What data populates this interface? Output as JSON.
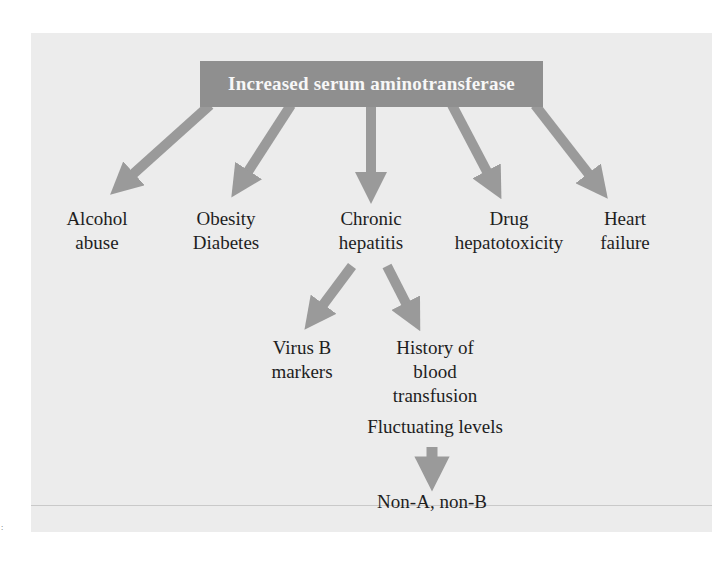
{
  "diagram": {
    "root": {
      "label": "Increased serum aminotransferase"
    },
    "causes": [
      {
        "id": "alcohol",
        "lines": [
          "Alcohol",
          "abuse"
        ]
      },
      {
        "id": "obesity",
        "lines": [
          "Obesity",
          "Diabetes"
        ]
      },
      {
        "id": "chronic-hepatitis",
        "lines": [
          "Chronic",
          "hepatitis"
        ]
      },
      {
        "id": "drug",
        "lines": [
          "Drug",
          "hepatotoxicity"
        ]
      },
      {
        "id": "heart",
        "lines": [
          "Heart",
          "failure"
        ]
      }
    ],
    "hepatitis_branches": [
      {
        "id": "virus-b",
        "lines": [
          "Virus B",
          "markers"
        ]
      },
      {
        "id": "transfusion",
        "lines": [
          "History of",
          "blood",
          "transfusion"
        ]
      }
    ],
    "transfusion_followup": {
      "label": "Fluctuating levels"
    },
    "conclusion": {
      "label": "Non-A, non-B"
    },
    "corner_mark": ":",
    "colors": {
      "panel": "#ececec",
      "arrow": "#9a9a9a",
      "box": "#8f8f8f",
      "box_text": "#f7f7f7",
      "text": "#1e1e1e"
    }
  }
}
